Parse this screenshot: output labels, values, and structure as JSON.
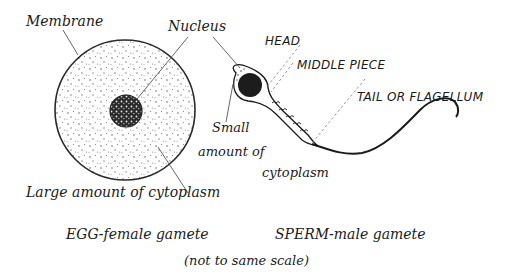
{
  "diagram": {
    "type": "labelled-biology-illustration"
  },
  "egg": {
    "labels": {
      "membrane": "Membrane",
      "nucleus": "Nucleus",
      "cytoplasm": "Large amount of cytoplasm"
    },
    "caption": "EGG-female gamete"
  },
  "sperm": {
    "labels": {
      "head": "HEAD",
      "middle_piece": "MIDDLE PIECE",
      "tail": "TAIL OR FLAGELLUM",
      "cytoplasm_line1": "Small",
      "cytoplasm_line2": "amount of",
      "cytoplasm_line3": "cytoplasm"
    },
    "caption": "SPERM-male gamete"
  },
  "footnote": "(not to same scale)",
  "colors": {
    "ink": "#1a1a1a",
    "leader": "#555555",
    "dots": "#6b6b6b",
    "nucleus": "#1c1c1c"
  }
}
